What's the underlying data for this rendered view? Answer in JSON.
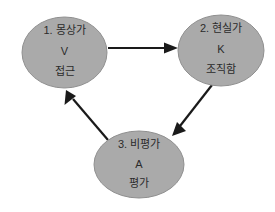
{
  "diagram": {
    "title": "",
    "background_color": "#ffffff",
    "node_fill_color": "#aaaaaa",
    "node_stroke_color": "#8f8f8f",
    "edge_color": "#1a1a1a",
    "text_color": "#2b2b2b",
    "nodes": [
      {
        "id": "node-1",
        "name": "dreamer",
        "cx": 64.5,
        "cy": 52.5,
        "rx": 42.5,
        "ry": 35.5,
        "line1": "1. 몽상가",
        "line2": "V",
        "line3": "접근"
      },
      {
        "id": "node-2",
        "name": "realist",
        "cx": 221,
        "cy": 50.5,
        "rx": 43,
        "ry": 35.5,
        "line1": "2. 현실가",
        "line2": "K",
        "line3": "조직함"
      },
      {
        "id": "node-3",
        "name": "critic",
        "cx": 139,
        "cy": 164.5,
        "rx": 45,
        "ry": 33.5,
        "line1": "3. 비평가",
        "line2": "A",
        "line3": "평가"
      }
    ],
    "edges": [
      {
        "id": "edge-1-2",
        "name": "dreamer-to-realist",
        "from": "node-1",
        "to": "node-2",
        "direction": "right",
        "label": ""
      },
      {
        "id": "edge-2-3",
        "name": "realist-to-critic",
        "from": "node-2",
        "to": "node-3",
        "direction": "down-left",
        "label": ""
      },
      {
        "id": "edge-3-1",
        "name": "critic-to-dreamer",
        "from": "node-3",
        "to": "node-1",
        "direction": "up-left",
        "label": ""
      }
    ]
  }
}
